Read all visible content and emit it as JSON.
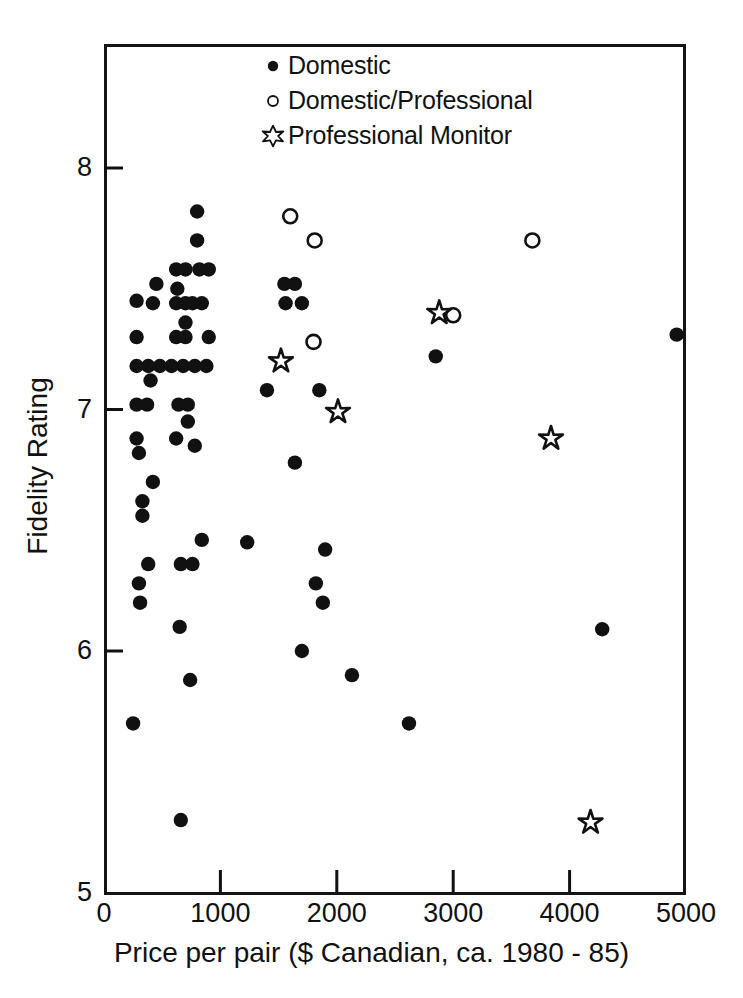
{
  "chart_data": {
    "type": "scatter",
    "title": "",
    "xlabel": "Price per pair ($ Canadian, ca. 1980 - 85)",
    "ylabel": "Fidelity Rating",
    "xlim": [
      0,
      5000
    ],
    "ylim": [
      5,
      8.3
    ],
    "xticks": [
      0,
      1000,
      2000,
      3000,
      4000,
      5000
    ],
    "xtick_labels": [
      "0",
      "1000",
      "2000",
      "3000",
      "4000",
      "5000"
    ],
    "yticks": [
      5,
      6,
      7,
      8
    ],
    "ytick_labels": [
      "5",
      "6",
      "7",
      "8"
    ],
    "grid": false,
    "legend_position": "top-center",
    "series": [
      {
        "name": "Domestic",
        "marker": "filled-circle",
        "color": "#111111",
        "points": [
          [
            800,
            7.82
          ],
          [
            800,
            7.7
          ],
          [
            620,
            7.58
          ],
          [
            700,
            7.58
          ],
          [
            820,
            7.58
          ],
          [
            900,
            7.58
          ],
          [
            450,
            7.52
          ],
          [
            630,
            7.5
          ],
          [
            1550,
            7.52
          ],
          [
            1640,
            7.52
          ],
          [
            280,
            7.45
          ],
          [
            420,
            7.44
          ],
          [
            620,
            7.44
          ],
          [
            700,
            7.44
          ],
          [
            760,
            7.44
          ],
          [
            840,
            7.44
          ],
          [
            1560,
            7.44
          ],
          [
            1700,
            7.44
          ],
          [
            700,
            7.36
          ],
          [
            280,
            7.3
          ],
          [
            620,
            7.3
          ],
          [
            700,
            7.3
          ],
          [
            900,
            7.3
          ],
          [
            280,
            7.18
          ],
          [
            380,
            7.18
          ],
          [
            480,
            7.18
          ],
          [
            580,
            7.18
          ],
          [
            680,
            7.18
          ],
          [
            780,
            7.18
          ],
          [
            880,
            7.18
          ],
          [
            400,
            7.12
          ],
          [
            2850,
            7.22
          ],
          [
            1400,
            7.08
          ],
          [
            1850,
            7.08
          ],
          [
            280,
            7.02
          ],
          [
            370,
            7.02
          ],
          [
            640,
            7.02
          ],
          [
            720,
            7.02
          ],
          [
            720,
            6.95
          ],
          [
            280,
            6.88
          ],
          [
            620,
            6.88
          ],
          [
            1640,
            6.78
          ],
          [
            300,
            6.82
          ],
          [
            420,
            6.7
          ],
          [
            780,
            6.85
          ],
          [
            330,
            6.62
          ],
          [
            330,
            6.56
          ],
          [
            1900,
            6.42
          ],
          [
            1230,
            6.45
          ],
          [
            840,
            6.46
          ],
          [
            380,
            6.36
          ],
          [
            660,
            6.36
          ],
          [
            760,
            6.36
          ],
          [
            300,
            6.28
          ],
          [
            1820,
            6.28
          ],
          [
            310,
            6.2
          ],
          [
            1880,
            6.2
          ],
          [
            650,
            6.1
          ],
          [
            4280,
            6.09
          ],
          [
            1700,
            6.0
          ],
          [
            740,
            5.88
          ],
          [
            2130,
            5.9
          ],
          [
            250,
            5.7
          ],
          [
            2620,
            5.7
          ],
          [
            660,
            5.3
          ],
          [
            4920,
            7.31
          ]
        ]
      },
      {
        "name": "Domestic/Professional",
        "marker": "open-circle",
        "color": "#111111",
        "points": [
          [
            1600,
            7.8
          ],
          [
            1810,
            7.7
          ],
          [
            3680,
            7.7
          ],
          [
            1800,
            7.28
          ],
          [
            3000,
            7.39
          ]
        ]
      },
      {
        "name": "Professional Monitor",
        "marker": "open-star",
        "color": "#111111",
        "points": [
          [
            2880,
            7.4
          ],
          [
            1520,
            7.2
          ],
          [
            2010,
            6.99
          ],
          [
            3840,
            6.88
          ],
          [
            4180,
            5.29
          ]
        ]
      }
    ]
  },
  "legend": {
    "entries": [
      {
        "marker": "filled-circle",
        "label": "Domestic"
      },
      {
        "marker": "open-circle",
        "label": "Domestic/Professional"
      },
      {
        "marker": "open-star",
        "label": "Professional Monitor"
      }
    ]
  },
  "axes": {
    "y_title": "Fidelity Rating",
    "x_title": "Price per pair ($ Canadian, ca. 1980 - 85)",
    "y_tick_labels": [
      "5",
      "6",
      "7",
      "8"
    ],
    "x_tick_labels": [
      "0",
      "1000",
      "2000",
      "3000",
      "4000",
      "5000"
    ]
  },
  "colors": {
    "foreground": "#111111",
    "background": "#ffffff"
  }
}
